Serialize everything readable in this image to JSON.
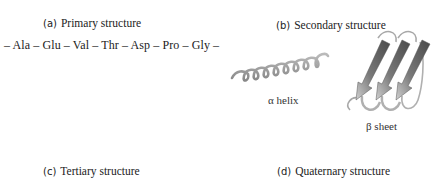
{
  "panels": {
    "a": {
      "tag": "(a)",
      "title": "Primary structure",
      "sequence": "– Ala – Glu – Val – Thr – Asp – Pro – Gly –"
    },
    "b": {
      "tag": "(b)",
      "title": "Secondary structure",
      "helix_label": "α helix",
      "sheet_label": "β sheet"
    },
    "c": {
      "tag": "(c)",
      "title": "Tertiary structure"
    },
    "d": {
      "tag": "(d)",
      "title": "Quaternary structure"
    }
  },
  "colors": {
    "text": "#222222",
    "ribbon": "#9a9a9a",
    "arrow_dark": "#555555",
    "arrow_light": "#c8c8c8"
  }
}
